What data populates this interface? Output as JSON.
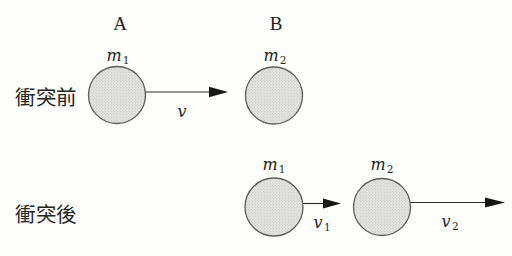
{
  "figure": {
    "stage_before": {
      "label": "衝突前",
      "ball_a": {
        "name": "A",
        "mass_base": "m",
        "mass_sub": "1"
      },
      "ball_b": {
        "name": "B",
        "mass_base": "m",
        "mass_sub": "2"
      },
      "velocity": {
        "base": "v"
      }
    },
    "stage_after": {
      "label": "衝突後",
      "ball_a": {
        "mass_base": "m",
        "mass_sub": "1"
      },
      "ball_b": {
        "mass_base": "m",
        "mass_sub": "2"
      },
      "velocity1": {
        "base": "v",
        "sub": "1"
      },
      "velocity2": {
        "base": "v",
        "sub": "2"
      }
    },
    "colors": {
      "background": "#fdfdfb",
      "ball_fill": "#e4e4e2",
      "ball_dot": "#b2b2b0",
      "ball_outline": "#5c5c5a",
      "arrow": "#161614",
      "text": "#262624"
    }
  }
}
